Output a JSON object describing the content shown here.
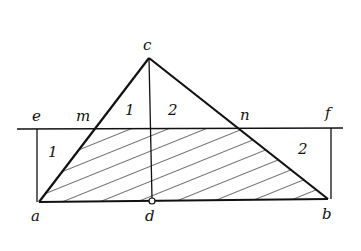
{
  "diagram": {
    "points": {
      "c": {
        "label": "c",
        "x": 149,
        "y": 58
      },
      "a": {
        "label": "a",
        "x": 39,
        "y": 202
      },
      "b": {
        "label": "b",
        "x": 328,
        "y": 199
      },
      "d": {
        "label": "d",
        "x": 152,
        "y": 201
      },
      "e": {
        "label": "e",
        "x": 37,
        "y": 129
      },
      "f": {
        "label": "f",
        "x": 331,
        "y": 128
      },
      "m": {
        "label": "m",
        "x": 96,
        "y": 129
      },
      "n": {
        "label": "n",
        "x": 238,
        "y": 128
      }
    },
    "region_labels": [
      {
        "text": "1",
        "x": 125,
        "y": 103
      },
      {
        "text": "2",
        "x": 168,
        "y": 103
      },
      {
        "text": "1",
        "x": 48,
        "y": 145
      },
      {
        "text": "2",
        "x": 298,
        "y": 142
      }
    ],
    "hatched_region": "a-m-n-b trapezoid",
    "line_color": "#111111"
  }
}
